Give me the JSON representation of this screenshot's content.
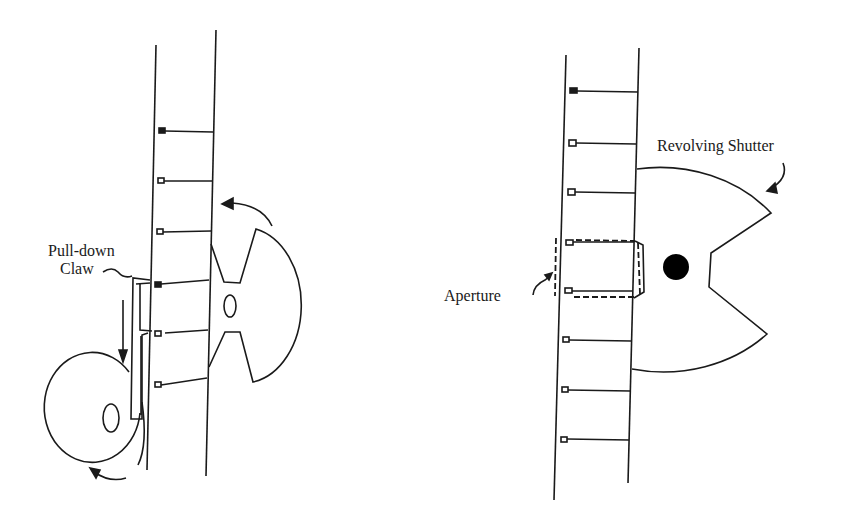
{
  "figure": {
    "type": "diagram"
  },
  "left_panel": {
    "labels": {
      "claw_line1": "Pull-down",
      "claw_line2": "Claw"
    },
    "components": [
      "film-strip",
      "sprocket-holes",
      "pull-down-claw",
      "cam-wheel",
      "revolving-shutter",
      "rotation-arrows"
    ],
    "sprocket_hole_count": 6
  },
  "right_panel": {
    "labels": {
      "shutter": "Revolving Shutter",
      "aperture": "Aperture"
    },
    "components": [
      "film-strip",
      "sprocket-holes",
      "aperture-frame",
      "revolving-shutter"
    ],
    "sprocket_hole_count": 8
  }
}
